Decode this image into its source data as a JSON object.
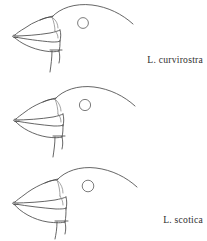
{
  "figure": {
    "type": "line-drawing-plate",
    "background_color": "#ffffff",
    "ink_color": "#4a4a4a",
    "label_color": "#2e2e2e",
    "panel_count": 3
  },
  "panels": [
    {
      "id": "panel-1",
      "label": "L. curvirostra",
      "icon": "bird-head-profile-icon",
      "eye": {
        "cx": 83,
        "cy": 23,
        "r": 5.4
      },
      "bill_depth": "shallow"
    },
    {
      "id": "panel-2",
      "label": "L. scotica",
      "icon": "bird-head-profile-icon",
      "eye": {
        "cx": 85,
        "cy": 25,
        "r": 5.6
      },
      "bill_depth": "medium"
    },
    {
      "id": "panel-3",
      "label": "L. pytyopsittacus",
      "icon": "bird-head-profile-icon",
      "eye": {
        "cx": 88,
        "cy": 26,
        "r": 5.8
      },
      "bill_depth": "deep"
    }
  ]
}
